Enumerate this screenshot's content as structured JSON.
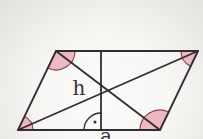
{
  "figure": {
    "shape": "parallelogram-with-diagonals-and-height",
    "labels": {
      "height": "h",
      "base": "a"
    },
    "markers": {
      "right_angle": "arc-with-dot",
      "corner_angles": "shaded-sectors-at-all-four-vertices"
    },
    "colors": {
      "line": "#2f2f2f",
      "angle_fill": "#eeb7c1",
      "angle_stroke": "#7d454e",
      "background": "#f4f3f0"
    }
  }
}
